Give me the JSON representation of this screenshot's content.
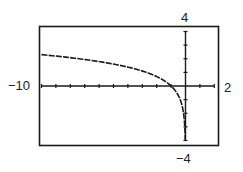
{
  "chart_data": {
    "type": "line",
    "title": "",
    "function": "y = ln(-x)",
    "xlabel": "",
    "ylabel": "",
    "xlim": [
      -10,
      2
    ],
    "ylim": [
      -4,
      4
    ],
    "xscl": 1,
    "yscl": 1,
    "grid": false,
    "legend": null,
    "tick_labels": {
      "xmin": "−10",
      "xmax": "2",
      "ymax": "4",
      "ymin": "−4"
    },
    "series": [
      {
        "name": "f(x)",
        "x": [
          -10,
          -9,
          -8,
          -7,
          -6,
          -5,
          -4,
          -3,
          -2,
          -1.5,
          -1,
          -0.7,
          -0.5,
          -0.3,
          -0.2,
          -0.1,
          -0.05,
          -0.03,
          -0.018
        ],
        "y": [
          2.303,
          2.197,
          2.079,
          1.946,
          1.792,
          1.609,
          1.386,
          1.099,
          0.693,
          0.405,
          0,
          -0.357,
          -0.693,
          -1.204,
          -1.609,
          -2.303,
          -2.996,
          -3.507,
          -4.0
        ]
      }
    ]
  },
  "labels": {
    "xmin": "−10",
    "xmax": "2",
    "ymax": "4",
    "ymin": "−4"
  },
  "colors": {
    "ink": "#1a1a1a",
    "background": "#ffffff"
  }
}
